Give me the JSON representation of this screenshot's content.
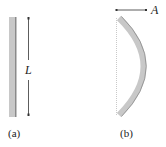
{
  "figure": {
    "panel_a": {
      "caption": "(a)",
      "dimension_label": "L",
      "description": "straight vertical rod of length L"
    },
    "panel_b": {
      "caption": "(b)",
      "dimension_label": "A",
      "description": "rod buckled into a curved shape with lateral deflection A"
    },
    "colors": {
      "rod_fill": "#c8c8c8",
      "rod_edge": "#8a8a8a",
      "line": "#333333",
      "dotted_line": "#bbbbbb"
    }
  }
}
